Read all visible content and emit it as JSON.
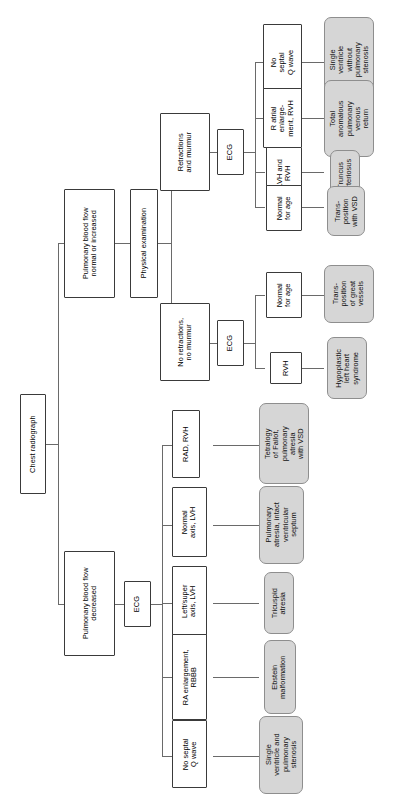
{
  "diagram": {
    "type": "flowchart",
    "orientation": "rotated-90-ccw",
    "colors": {
      "decision_fill": "#ffffff",
      "decision_border": "#3a3a3a",
      "terminal_fill": "#d6d6d6",
      "terminal_border": "#8e8e8e",
      "connector": "#6a6a6a",
      "text": "#000000"
    }
  },
  "root": {
    "label": "Chest radiograph"
  },
  "branches": {
    "upper": {
      "label": "Pulmonary blood flow\nnormal or increased",
      "exam": {
        "label": "Physical examination"
      },
      "findings": [
        {
          "label": "Retractions\nand murmur",
          "test": "ECG",
          "results": [
            {
              "ecg": "No\nseptal\nQ wave",
              "outcome": "Single\nventricle\nwithout\npulmonary\nstenosis"
            },
            {
              "ecg": "R atrial\nenlarge-\nment, RVH",
              "outcome": "Total\nanomalous\npulmonary\nvenous\nreturn"
            },
            {
              "ecg": "LVH and\nRVH",
              "outcome": "Truncus\narteriosus"
            },
            {
              "ecg": "Normal\nfor age",
              "outcome": "Trans-\nposition\nwith VSD"
            }
          ]
        },
        {
          "label": "No retractions,\nno murmur",
          "test": "ECG",
          "results": [
            {
              "ecg": "Normal\nfor age",
              "outcome": "Trans-\nposition\nof great\nvessels"
            },
            {
              "ecg": "RVH",
              "outcome": "Hypoplastic\nleft heart\nsyndrome"
            }
          ]
        }
      ]
    },
    "lower": {
      "label": "Pulmonary blood flow\ndecreased",
      "test": "ECG",
      "results": [
        {
          "ecg": "RAD, RVH",
          "outcome": "Tetralogy\nof Fallot,\npulmonary\natresia\nwith VSD"
        },
        {
          "ecg": "Normal\naxis, LVH",
          "outcome": "Pulmonary\natresia, intact\nventricular\nseptum"
        },
        {
          "ecg": "Left/super\naxis, LVH",
          "outcome": "Tricuspid\natresia"
        },
        {
          "ecg": "RA enlargement,\nRBBB",
          "outcome": "Ebstein\nmalformation"
        },
        {
          "ecg": "No septal\nQ wave",
          "outcome": "Single\nventricle and\npulmonary\nstenosis"
        }
      ]
    }
  }
}
